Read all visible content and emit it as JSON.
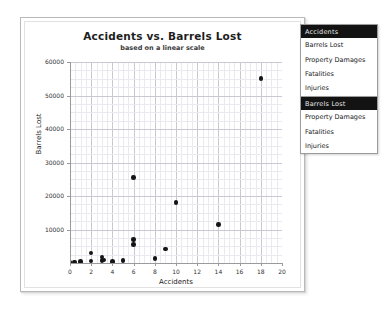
{
  "chart_card": {
    "title": "Accidents vs. Barrels Lost",
    "subtitle": "based on a linear scale"
  },
  "chart_data": {
    "type": "scatter",
    "title": "Accidents vs. Barrels Lost",
    "subtitle": "based on a linear scale",
    "xlabel": "Accidents",
    "ylabel": "Barrels Lost",
    "xlim": [
      0,
      20
    ],
    "ylim": [
      0,
      60000
    ],
    "xticks": [
      0,
      2,
      4,
      6,
      8,
      10,
      12,
      14,
      16,
      18,
      20
    ],
    "xticklabels": [
      "0",
      "2",
      "4",
      "6",
      "8",
      "10",
      "12",
      "14",
      "16",
      "18",
      "20"
    ],
    "yticks": [
      10000,
      20000,
      30000,
      40000,
      50000,
      60000
    ],
    "yticklabels": [
      "10000",
      "20000",
      "30000",
      "40000",
      "50000",
      "60000"
    ],
    "grid": true,
    "minor_grid": true,
    "legend": "none",
    "marker_color": "#151515",
    "series": [
      {
        "name": "Barrels Lost",
        "points": [
          [
            0,
            200
          ],
          [
            0.4,
            300
          ],
          [
            1,
            400
          ],
          [
            2,
            600
          ],
          [
            2,
            3000
          ],
          [
            3,
            700
          ],
          [
            3,
            1800
          ],
          [
            3.2,
            900
          ],
          [
            4,
            500
          ],
          [
            5,
            800
          ],
          [
            6,
            7000
          ],
          [
            6,
            5500
          ],
          [
            6,
            25500
          ],
          [
            8,
            1400
          ],
          [
            9,
            4200
          ],
          [
            10,
            18000
          ],
          [
            14,
            11500
          ],
          [
            18,
            55000
          ]
        ]
      }
    ]
  },
  "menus": [
    {
      "id": "accidents",
      "header": "Accidents",
      "items": [
        "Barrels Lost",
        "Property Damages",
        "Fatalities",
        "Injuries"
      ]
    },
    {
      "id": "barrels",
      "header": "Barrels Lost",
      "items": [
        "Property Damages",
        "Fatalities",
        "Injuries"
      ]
    }
  ]
}
